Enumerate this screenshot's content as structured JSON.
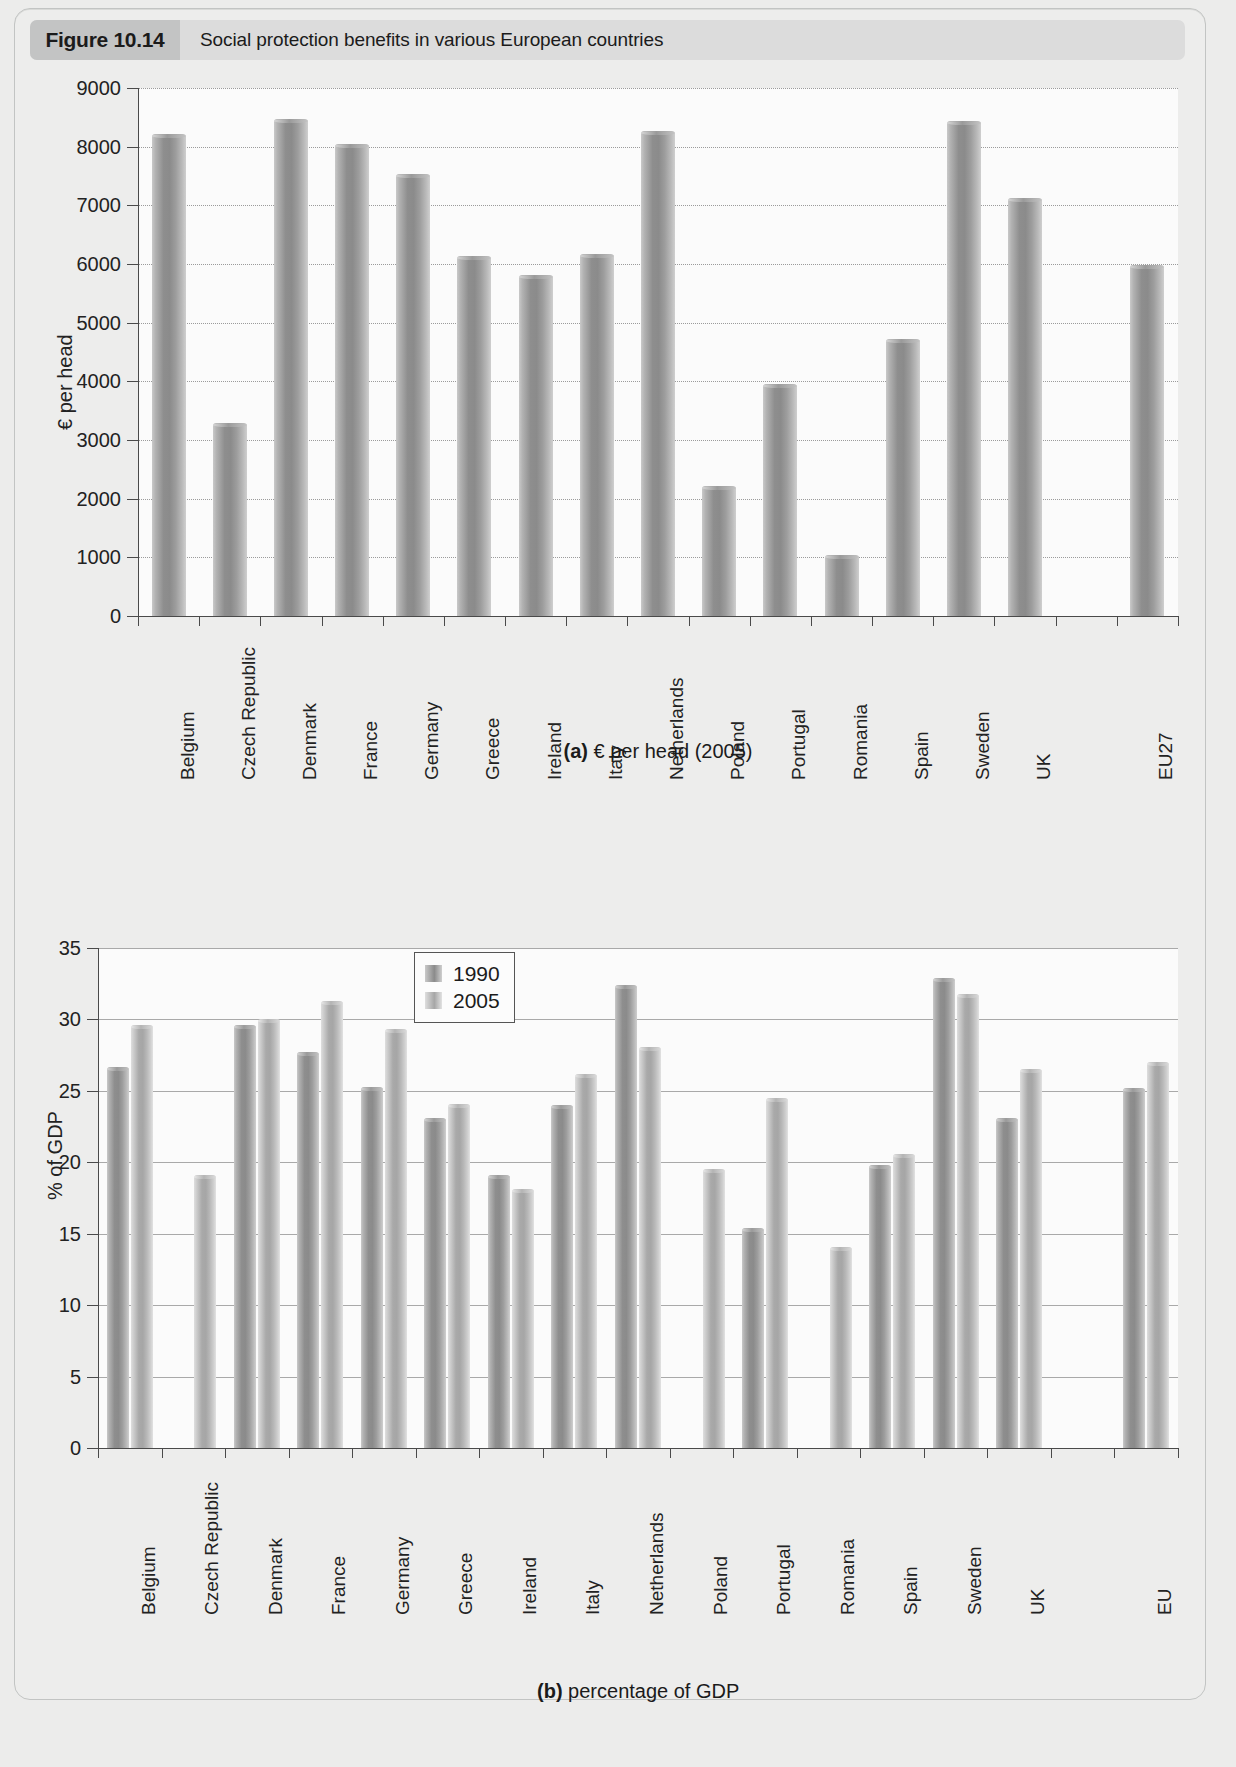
{
  "figure": {
    "number": "Figure 10.14",
    "title": "Social protection benefits in various European countries"
  },
  "chart_data": [
    {
      "id": "a",
      "type": "bar",
      "title": "",
      "caption_prefix": "(a)",
      "caption_text": "€ per head (2005)",
      "xlabel": "",
      "ylabel": "€ per head",
      "ylim": [
        0,
        9000
      ],
      "yticks": [
        0,
        1000,
        2000,
        3000,
        4000,
        5000,
        6000,
        7000,
        8000,
        9000
      ],
      "ytick_labels": [
        "0",
        "1000",
        "2000",
        "3000",
        "4000",
        "5000",
        "6000",
        "7000",
        "8000",
        "9000"
      ],
      "grid": true,
      "legend": false,
      "categories": [
        "Belgium",
        "Czech Republic",
        "Denmark",
        "France",
        "Germany",
        "Greece",
        "Ireland",
        "Italy",
        "Netherlands",
        "Poland",
        "Portugal",
        "Romania",
        "Spain",
        "Sweden",
        "UK",
        "",
        "EU27"
      ],
      "values": [
        8220,
        3290,
        8470,
        8040,
        7530,
        6130,
        5820,
        6170,
        8270,
        2210,
        3960,
        1040,
        4720,
        8440,
        7120,
        null,
        5990
      ]
    },
    {
      "id": "b",
      "type": "bar",
      "title": "",
      "caption_prefix": "(b)",
      "caption_text": "percentage of GDP",
      "xlabel": "",
      "ylabel": "% of GDP",
      "ylim": [
        0,
        35
      ],
      "yticks": [
        0,
        5,
        10,
        15,
        20,
        25,
        30,
        35
      ],
      "ytick_labels": [
        "0",
        "5",
        "10",
        "15",
        "20",
        "25",
        "30",
        "35"
      ],
      "grid": true,
      "legend": true,
      "legend_position": "top-center",
      "categories": [
        "Belgium",
        "Czech Republic",
        "Denmark",
        "France",
        "Germany",
        "Greece",
        "Ireland",
        "Italy",
        "Netherlands",
        "Poland",
        "Portugal",
        "Romania",
        "Spain",
        "Sweden",
        "UK",
        "",
        "EU"
      ],
      "series": [
        {
          "name": "1990",
          "values": [
            26.7,
            null,
            29.6,
            27.7,
            25.3,
            23.1,
            19.1,
            24.0,
            32.4,
            null,
            15.4,
            null,
            19.8,
            32.9,
            23.1,
            null,
            25.2
          ]
        },
        {
          "name": "2005",
          "values": [
            29.6,
            19.1,
            30.0,
            31.3,
            29.3,
            24.1,
            18.1,
            26.2,
            28.1,
            19.5,
            24.5,
            14.1,
            20.6,
            31.8,
            26.5,
            null,
            27.0
          ]
        }
      ]
    }
  ]
}
